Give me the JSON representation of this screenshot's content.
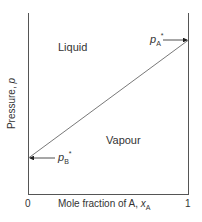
{
  "diagram": {
    "type": "pressure-composition phase diagram",
    "regions": {
      "upper": "Liquid",
      "lower": "Vapour"
    },
    "axes": {
      "y_label": "Pressure, ",
      "y_symbol": "p",
      "x_label": "Mole fraction of A, ",
      "x_symbol": "x",
      "x_symbol_sub": "A",
      "x_tick_min": "0",
      "x_tick_max": "1"
    },
    "annotations": {
      "pA": {
        "symbol": "p",
        "sub": "A",
        "sup": "*"
      },
      "pB": {
        "symbol": "p",
        "sub": "B",
        "sup": "*"
      }
    },
    "line": {
      "from": "p_B* at x_A=0",
      "to": "p_A* at x_A=1"
    },
    "colors": {
      "line": "#555555",
      "text": "#333333"
    }
  }
}
